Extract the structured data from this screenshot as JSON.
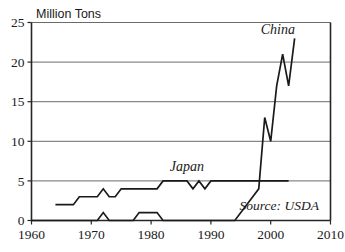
{
  "chart_data": {
    "type": "line",
    "title": "Million Tons",
    "xlabel": "",
    "ylabel": "Million Tons",
    "xlim": [
      1960,
      2010
    ],
    "ylim": [
      0,
      25
    ],
    "xticks": [
      1960,
      1970,
      1980,
      1990,
      2000,
      2010
    ],
    "yticks": [
      0,
      5,
      10,
      15,
      20,
      25
    ],
    "xtick_labels": [
      "1960",
      "1970",
      "1980",
      "1990",
      "2000",
      "2010"
    ],
    "ytick_labels": [
      "0",
      "5",
      "10",
      "15",
      "20",
      "25"
    ],
    "grid": "horizontal",
    "legend_position": "inline-annotation",
    "annotations": [
      {
        "text": "China",
        "x": 2001.2,
        "y": 23.6
      },
      {
        "text": "Japan",
        "x": 1986.0,
        "y": 6.2
      },
      {
        "text": "Source: USDA",
        "x": 1994.8,
        "y": 1.35
      }
    ],
    "series": [
      {
        "name": "Japan",
        "x": [
          1964,
          1967,
          1968,
          1971,
          1972,
          1973,
          1974,
          1975,
          1981,
          1982,
          1986,
          1987,
          1988,
          1989,
          1990,
          1991,
          2003
        ],
        "values": [
          2,
          2,
          3,
          3,
          4,
          3,
          3,
          4,
          4,
          5,
          5,
          4,
          5,
          4,
          5,
          5,
          5
        ]
      },
      {
        "name": "China",
        "x": [
          1960,
          1971,
          1972,
          1973,
          1977,
          1978,
          1979,
          1981,
          1982,
          1994,
          1997,
          1998,
          1999,
          2000,
          2001,
          2002,
          2003,
          2004
        ],
        "values": [
          0,
          0,
          1,
          0,
          0,
          1,
          1,
          1,
          0,
          0,
          3,
          4,
          13,
          10,
          17,
          21,
          17,
          23
        ]
      }
    ]
  }
}
